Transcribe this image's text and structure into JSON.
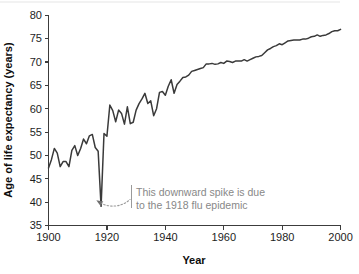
{
  "chart_data": {
    "type": "line",
    "title": "",
    "xlabel": "Year",
    "ylabel": "Age of life expectancy (years)",
    "xlim": [
      1900,
      2000
    ],
    "ylim": [
      35,
      80
    ],
    "grid": false,
    "legend": "none",
    "line_color": "#3a3a3a",
    "annotation_color": "#888888",
    "xticks": [
      1900,
      1920,
      1940,
      1960,
      1980,
      2000
    ],
    "xtick_labels": [
      "1900",
      "1920",
      "1940",
      "1960",
      "1980",
      "2000"
    ],
    "yticks": [
      35,
      40,
      45,
      50,
      55,
      60,
      65,
      70,
      75,
      80
    ],
    "ytick_labels": [
      "35",
      "40",
      "45",
      "50",
      "55",
      "60",
      "65",
      "70",
      "75",
      "80"
    ],
    "annotations": [
      {
        "name": "flu-epidemic-note",
        "line1": "This downward spike is due",
        "line2": "to the 1918 flu epidemic",
        "points_to_year": 1918,
        "points_to_value": 39.2
      }
    ],
    "series": [
      {
        "name": "Life expectancy at birth",
        "x": [
          1900,
          1901,
          1902,
          1903,
          1904,
          1905,
          1906,
          1907,
          1908,
          1909,
          1910,
          1911,
          1912,
          1913,
          1914,
          1915,
          1916,
          1917,
          1918,
          1919,
          1920,
          1921,
          1922,
          1923,
          1924,
          1925,
          1926,
          1927,
          1928,
          1929,
          1930,
          1931,
          1932,
          1933,
          1934,
          1935,
          1936,
          1937,
          1938,
          1939,
          1940,
          1941,
          1942,
          1943,
          1944,
          1945,
          1946,
          1947,
          1948,
          1949,
          1950,
          1951,
          1952,
          1953,
          1954,
          1955,
          1956,
          1957,
          1958,
          1959,
          1960,
          1961,
          1962,
          1963,
          1964,
          1965,
          1966,
          1967,
          1968,
          1969,
          1970,
          1971,
          1972,
          1973,
          1974,
          1975,
          1976,
          1977,
          1978,
          1979,
          1980,
          1981,
          1982,
          1983,
          1984,
          1985,
          1986,
          1987,
          1988,
          1989,
          1990,
          1991,
          1992,
          1993,
          1994,
          1995,
          1996,
          1997,
          1998,
          1999,
          2000
        ],
        "values": [
          47.3,
          49.1,
          51.5,
          50.5,
          47.6,
          48.7,
          48.7,
          47.6,
          51.1,
          52.1,
          50.0,
          51.5,
          53.5,
          52.5,
          54.2,
          54.5,
          51.7,
          50.9,
          39.1,
          54.7,
          54.1,
          60.8,
          59.6,
          57.2,
          59.7,
          59.0,
          56.7,
          60.4,
          56.8,
          57.1,
          59.7,
          61.1,
          62.1,
          63.3,
          61.1,
          61.7,
          58.5,
          60.0,
          63.5,
          63.7,
          62.9,
          64.8,
          66.2,
          63.3,
          65.2,
          65.9,
          66.7,
          66.8,
          67.2,
          68.0,
          68.2,
          68.4,
          68.6,
          68.8,
          69.6,
          69.6,
          69.7,
          69.5,
          69.6,
          69.9,
          69.7,
          70.2,
          70.1,
          69.9,
          70.2,
          70.2,
          70.2,
          70.5,
          70.2,
          70.5,
          70.8,
          71.1,
          71.2,
          71.4,
          72.0,
          72.6,
          72.9,
          73.3,
          73.5,
          73.9,
          73.7,
          74.1,
          74.5,
          74.6,
          74.7,
          74.7,
          74.7,
          74.9,
          74.9,
          75.1,
          75.4,
          75.5,
          75.8,
          75.5,
          75.7,
          75.8,
          76.1,
          76.5,
          76.7,
          76.7,
          77.0
        ]
      }
    ]
  },
  "axes": {
    "y_title": "Age of life expectancy (years)",
    "x_title": "Year"
  }
}
